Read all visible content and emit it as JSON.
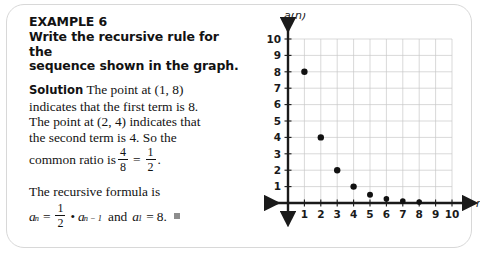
{
  "example": {
    "title": "EXAMPLE 6",
    "prompt_line_1": "Write the recursive rule for the",
    "prompt_line_2": "sequence shown in the graph."
  },
  "solution": {
    "label": "Solution",
    "line_1": "The point at (1, 8)",
    "line_2": "indicates that the first term is 8.",
    "line_3": "The point at (2, 4) indicates that",
    "line_4": "the second term is 4. So the",
    "line_5_prefix": "common ratio is",
    "ratio_left_num": "4",
    "ratio_left_den": "8",
    "equals": "=",
    "ratio_right_num": "1",
    "ratio_right_den": "2",
    "ratio_period": ".",
    "recursive_intro": "The recursive formula is",
    "formula": {
      "a_symbol": "a",
      "a_sub_n": "n",
      "equals": "=",
      "coef_num": "1",
      "coef_den": "2",
      "times": "•",
      "prev_symbol": "a",
      "prev_sub": "n − 1",
      "conjunction": "and",
      "first_symbol": "a",
      "first_sub": "1",
      "first_equals": "=",
      "first_value": "8."
    }
  },
  "chart_data": {
    "type": "scatter",
    "title": "",
    "xlabel": "n",
    "ylabel": "a(n)",
    "xlim": [
      0,
      10
    ],
    "ylim": [
      0,
      10
    ],
    "grid": true,
    "legend": "none",
    "x_ticks": [
      "1",
      "2",
      "3",
      "4",
      "5",
      "6",
      "7",
      "8",
      "9",
      "10"
    ],
    "y_ticks": [
      "1",
      "2",
      "3",
      "4",
      "5",
      "6",
      "7",
      "8",
      "9",
      "10"
    ],
    "x": [
      1,
      2,
      3,
      4,
      5,
      6,
      7,
      8
    ],
    "y": [
      8,
      4,
      2,
      1,
      0.5,
      0.25,
      0.125,
      0.0625
    ],
    "point_color": "#111111",
    "grid_color": "#c9c9c9",
    "axis_color": "#1a1a1a"
  }
}
